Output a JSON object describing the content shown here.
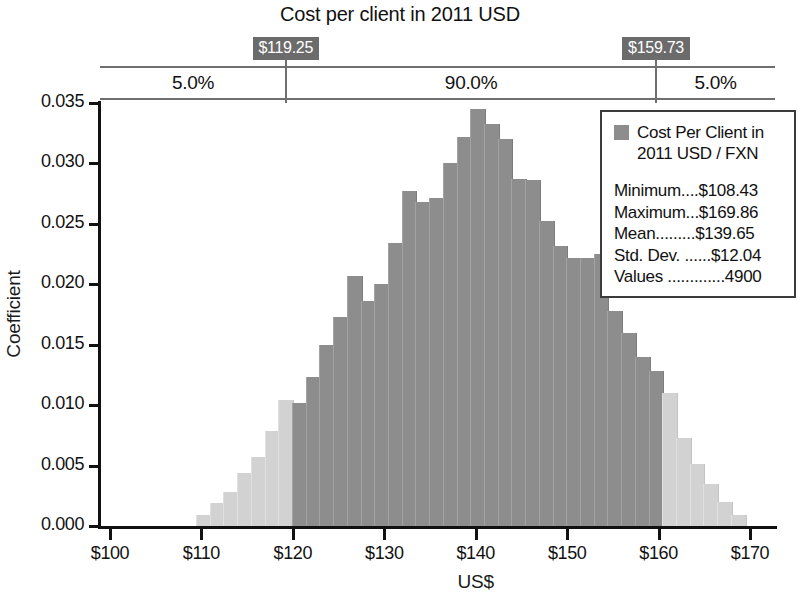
{
  "chart_data": {
    "type": "bar",
    "title": "Cost per client in 2011 USD",
    "xlabel": "US$",
    "ylabel": "Coefficient",
    "xlim": [
      100,
      170
    ],
    "ylim": [
      0.0,
      0.035
    ],
    "xticks": [
      "$100",
      "$110",
      "$120",
      "$130",
      "$140",
      "$150",
      "$160",
      "$170"
    ],
    "xtick_values": [
      100,
      110,
      120,
      130,
      140,
      150,
      160,
      170
    ],
    "yticks": [
      "0.000",
      "0.005",
      "0.010",
      "0.015",
      "0.020",
      "0.025",
      "0.030",
      "0.035"
    ],
    "ytick_values": [
      0.0,
      0.005,
      0.01,
      0.015,
      0.02,
      0.025,
      0.03,
      0.035
    ],
    "grid": false,
    "bin_width": 1.5,
    "bar_color_inside": "#8d8d8d",
    "bar_color_outside": "#d2d2d2",
    "marker_color": "#6b6b6b",
    "bins": [
      {
        "x": 109.4,
        "value": 0.0009,
        "inside": false
      },
      {
        "x": 110.9,
        "value": 0.0019,
        "inside": false
      },
      {
        "x": 112.4,
        "value": 0.0028,
        "inside": false
      },
      {
        "x": 113.9,
        "value": 0.0044,
        "inside": false
      },
      {
        "x": 115.4,
        "value": 0.0057,
        "inside": false
      },
      {
        "x": 116.9,
        "value": 0.0079,
        "inside": false
      },
      {
        "x": 118.4,
        "value": 0.0104,
        "inside": false
      },
      {
        "x": 119.9,
        "value": 0.0102,
        "inside": true
      },
      {
        "x": 121.4,
        "value": 0.0123,
        "inside": true
      },
      {
        "x": 122.9,
        "value": 0.015,
        "inside": true
      },
      {
        "x": 124.4,
        "value": 0.0173,
        "inside": true
      },
      {
        "x": 125.9,
        "value": 0.0207,
        "inside": true
      },
      {
        "x": 127.4,
        "value": 0.0186,
        "inside": true
      },
      {
        "x": 128.9,
        "value": 0.02,
        "inside": true
      },
      {
        "x": 130.4,
        "value": 0.0234,
        "inside": true
      },
      {
        "x": 131.9,
        "value": 0.0277,
        "inside": true
      },
      {
        "x": 133.4,
        "value": 0.0268,
        "inside": true
      },
      {
        "x": 134.9,
        "value": 0.0271,
        "inside": true
      },
      {
        "x": 136.4,
        "value": 0.03,
        "inside": true
      },
      {
        "x": 137.9,
        "value": 0.0322,
        "inside": true
      },
      {
        "x": 139.4,
        "value": 0.0345,
        "inside": true
      },
      {
        "x": 140.9,
        "value": 0.0333,
        "inside": true
      },
      {
        "x": 142.4,
        "value": 0.032,
        "inside": true
      },
      {
        "x": 143.9,
        "value": 0.0287,
        "inside": true
      },
      {
        "x": 145.4,
        "value": 0.0286,
        "inside": true
      },
      {
        "x": 146.9,
        "value": 0.0252,
        "inside": true
      },
      {
        "x": 148.4,
        "value": 0.0232,
        "inside": true
      },
      {
        "x": 149.9,
        "value": 0.0222,
        "inside": true
      },
      {
        "x": 151.4,
        "value": 0.0222,
        "inside": true
      },
      {
        "x": 152.9,
        "value": 0.0225,
        "inside": true
      },
      {
        "x": 154.4,
        "value": 0.0178,
        "inside": true
      },
      {
        "x": 155.9,
        "value": 0.016,
        "inside": true
      },
      {
        "x": 157.4,
        "value": 0.014,
        "inside": true
      },
      {
        "x": 158.9,
        "value": 0.0128,
        "inside": true
      },
      {
        "x": 160.4,
        "value": 0.011,
        "inside": false
      },
      {
        "x": 161.9,
        "value": 0.0073,
        "inside": false
      },
      {
        "x": 163.4,
        "value": 0.0051,
        "inside": false
      },
      {
        "x": 164.9,
        "value": 0.0035,
        "inside": false
      },
      {
        "x": 166.4,
        "value": 0.002,
        "inside": false
      },
      {
        "x": 167.9,
        "value": 0.0009,
        "inside": false
      }
    ],
    "markers": [
      {
        "label": "$119.25",
        "value": 119.25
      },
      {
        "label": "$159.73",
        "value": 159.73
      }
    ],
    "bands": [
      {
        "label": "5.0%",
        "from": 100,
        "to": 119.25
      },
      {
        "label": "90.0%",
        "from": 119.25,
        "to": 159.73
      },
      {
        "label": "5.0%",
        "from": 159.73,
        "to": 173.5
      }
    ]
  },
  "legend": {
    "series_name": "Cost Per Client in 2011 USD / FXN",
    "stats": [
      "Minimum....$108.43",
      "Maximum...$169.86",
      "Mean.........$139.65",
      "Std. Dev. ......$12.04",
      "Values .............4900"
    ]
  }
}
